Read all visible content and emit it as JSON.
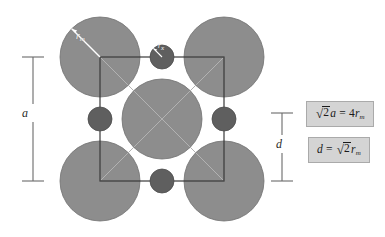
{
  "figure": {
    "name": "unit-cell-packing-diagram",
    "background_color": "#ffffff"
  },
  "colors": {
    "large_atom_fill": "#8d8d8d",
    "small_atom_fill": "#5f5f5f",
    "outline": "#4a4a4a",
    "cell_line": "#3a3a3a",
    "diagonal_line": "#9a9a9a",
    "dimension_line": "#6a6a6a",
    "formula_box_bg": "#d4d4d4",
    "formula_box_border": "#aaaaaa",
    "formula_text": "#1a1a1a",
    "white_callout": "#ffffff"
  },
  "cell": {
    "square_left": 100,
    "square_top": 57,
    "square_right": 224,
    "square_bottom": 181,
    "diagonals_shown": true
  },
  "atoms": {
    "large_radius": 40,
    "small_radius": 12,
    "large_positions": [
      {
        "name": "corner-top-left",
        "cx": 100,
        "cy": 57
      },
      {
        "name": "corner-top-right",
        "cx": 224,
        "cy": 57
      },
      {
        "name": "corner-bottom-left",
        "cx": 100,
        "cy": 181
      },
      {
        "name": "corner-bottom-right",
        "cx": 224,
        "cy": 181
      },
      {
        "name": "center",
        "cx": 162,
        "cy": 119
      }
    ],
    "small_positions": [
      {
        "name": "edge-top",
        "cx": 162,
        "cy": 57
      },
      {
        "name": "edge-left",
        "cx": 100,
        "cy": 119
      },
      {
        "name": "edge-right",
        "cx": 224,
        "cy": 119
      },
      {
        "name": "edge-bottom",
        "cx": 162,
        "cy": 181
      }
    ]
  },
  "labels": {
    "cell_edge": "a",
    "interstitial_gap": "d",
    "large_radius_symbol": "r",
    "large_radius_subscript": "m",
    "small_radius_symbol": "r",
    "small_radius_subscript": "x"
  },
  "dimensions": {
    "left": {
      "name": "cell-edge-dimension",
      "label": "a",
      "x": 33,
      "y_top": 57,
      "y_bottom": 181,
      "tick_half_width": 11
    },
    "right": {
      "name": "interstitial-gap-dimension",
      "label": "d",
      "x": 282,
      "y_top": 113,
      "y_bottom": 181,
      "tick_half_width": 11
    }
  },
  "formulas": [
    {
      "name": "formula-cell-edge-relation",
      "lhs_radical_index": "2",
      "lhs_variable": "a",
      "operator": "=",
      "rhs_coefficient": "4",
      "rhs_variable": "r",
      "rhs_subscript": "m",
      "plain_text": "√2a = 4rₘ"
    },
    {
      "name": "formula-interstitial-diameter",
      "lhs_variable": "d",
      "operator": "=",
      "rhs_radical_index": "2",
      "rhs_variable": "r",
      "rhs_subscript": "m",
      "plain_text": "d = √2rₘ"
    }
  ]
}
